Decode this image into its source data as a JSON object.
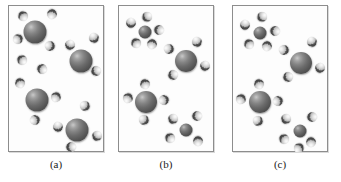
{
  "figure": {
    "type": "molecular-illustration",
    "panel_count": 3,
    "background_color": "#ffffff",
    "panel_border_color": "#8d8d8d",
    "panel_fill_color": "#fdfdfd"
  },
  "legend_colors": {
    "large_sphere": "#6b6b6b",
    "medium_sphere": "#5a5a5a",
    "small_sphere_light_lobe": "#e8e8e8",
    "small_sphere_dark_lobe": "#454545"
  },
  "panels": [
    {
      "label": "(a)",
      "arrangement": "dispersed",
      "large_spheres": 4,
      "small_spheres": 16,
      "particles": [
        {
          "kind": "big",
          "x": 27,
          "y": 27,
          "r": 11.5
        },
        {
          "kind": "big",
          "x": 73,
          "y": 56,
          "r": 11.5
        },
        {
          "kind": "big",
          "x": 29,
          "y": 95,
          "r": 11.5
        },
        {
          "kind": "big",
          "x": 69,
          "y": 125,
          "r": 11.5
        },
        {
          "kind": "small",
          "x": 15,
          "y": 11,
          "r": 5.2
        },
        {
          "kind": "small",
          "x": 44,
          "y": 9,
          "r": 5.2
        },
        {
          "kind": "small",
          "x": 10,
          "y": 34,
          "r": 5.2
        },
        {
          "kind": "small",
          "x": 42,
          "y": 41,
          "r": 5.2
        },
        {
          "kind": "small",
          "x": 86,
          "y": 33,
          "r": 5.2
        },
        {
          "kind": "small",
          "x": 62,
          "y": 40,
          "r": 5.2
        },
        {
          "kind": "small",
          "x": 88,
          "y": 66,
          "r": 5.2
        },
        {
          "kind": "small",
          "x": 34,
          "y": 64,
          "r": 5.2
        },
        {
          "kind": "small",
          "x": 12,
          "y": 78,
          "r": 5.2
        },
        {
          "kind": "small",
          "x": 48,
          "y": 92,
          "r": 5.2
        },
        {
          "kind": "small",
          "x": 27,
          "y": 115,
          "r": 5.2
        },
        {
          "kind": "small",
          "x": 77,
          "y": 101,
          "r": 5.2
        },
        {
          "kind": "small",
          "x": 50,
          "y": 122,
          "r": 5.2
        },
        {
          "kind": "small",
          "x": 89,
          "y": 131,
          "r": 5.2
        },
        {
          "kind": "small",
          "x": 63,
          "y": 142,
          "r": 5.2
        },
        {
          "kind": "small",
          "x": 14,
          "y": 55,
          "r": 5.2
        }
      ]
    },
    {
      "label": "(b)",
      "arrangement": "clustered",
      "large_spheres": 2,
      "medium_spheres": 2,
      "small_spheres": 16,
      "particles": [
        {
          "kind": "mid",
          "x": 27,
          "y": 27,
          "r": 6.5
        },
        {
          "kind": "small",
          "x": 13,
          "y": 18,
          "r": 5.2
        },
        {
          "kind": "small",
          "x": 29,
          "y": 12,
          "r": 5.2
        },
        {
          "kind": "small",
          "x": 41,
          "y": 25,
          "r": 5.2
        },
        {
          "kind": "small",
          "x": 18,
          "y": 38,
          "r": 5.2
        },
        {
          "kind": "small",
          "x": 34,
          "y": 39,
          "r": 5.2
        },
        {
          "kind": "big",
          "x": 68,
          "y": 56,
          "r": 11.0
        },
        {
          "kind": "small",
          "x": 51,
          "y": 44,
          "r": 5.2
        },
        {
          "kind": "small",
          "x": 79,
          "y": 37,
          "r": 5.2
        },
        {
          "kind": "small",
          "x": 87,
          "y": 61,
          "r": 5.2
        },
        {
          "kind": "small",
          "x": 55,
          "y": 70,
          "r": 5.2
        },
        {
          "kind": "big",
          "x": 28,
          "y": 97,
          "r": 11.0
        },
        {
          "kind": "small",
          "x": 27,
          "y": 79,
          "r": 5.2
        },
        {
          "kind": "small",
          "x": 10,
          "y": 93,
          "r": 5.2
        },
        {
          "kind": "small",
          "x": 46,
          "y": 95,
          "r": 5.2
        },
        {
          "kind": "small",
          "x": 26,
          "y": 115,
          "r": 5.2
        },
        {
          "kind": "mid",
          "x": 68,
          "y": 125,
          "r": 6.5
        },
        {
          "kind": "small",
          "x": 55,
          "y": 114,
          "r": 5.2
        },
        {
          "kind": "small",
          "x": 79,
          "y": 111,
          "r": 5.2
        },
        {
          "kind": "small",
          "x": 52,
          "y": 133,
          "r": 5.2
        },
        {
          "kind": "small",
          "x": 80,
          "y": 136,
          "r": 5.2
        }
      ]
    },
    {
      "label": "(c)",
      "arrangement": "clustered",
      "large_spheres": 2,
      "medium_spheres": 2,
      "small_spheres": 17,
      "particles": [
        {
          "kind": "mid",
          "x": 28,
          "y": 28,
          "r": 6.5
        },
        {
          "kind": "small",
          "x": 13,
          "y": 20,
          "r": 5.2
        },
        {
          "kind": "small",
          "x": 30,
          "y": 12,
          "r": 5.2
        },
        {
          "kind": "small",
          "x": 43,
          "y": 26,
          "r": 5.2
        },
        {
          "kind": "small",
          "x": 17,
          "y": 39,
          "r": 5.2
        },
        {
          "kind": "small",
          "x": 35,
          "y": 41,
          "r": 5.2
        },
        {
          "kind": "big",
          "x": 69,
          "y": 58,
          "r": 11.0
        },
        {
          "kind": "small",
          "x": 52,
          "y": 45,
          "r": 5.2
        },
        {
          "kind": "small",
          "x": 80,
          "y": 37,
          "r": 5.2
        },
        {
          "kind": "small",
          "x": 88,
          "y": 63,
          "r": 5.2
        },
        {
          "kind": "small",
          "x": 56,
          "y": 72,
          "r": 5.2
        },
        {
          "kind": "big",
          "x": 28,
          "y": 97,
          "r": 11.0
        },
        {
          "kind": "small",
          "x": 27,
          "y": 79,
          "r": 5.2
        },
        {
          "kind": "small",
          "x": 9,
          "y": 94,
          "r": 5.2
        },
        {
          "kind": "small",
          "x": 46,
          "y": 96,
          "r": 5.2
        },
        {
          "kind": "small",
          "x": 26,
          "y": 116,
          "r": 5.2
        },
        {
          "kind": "mid",
          "x": 68,
          "y": 126,
          "r": 6.5
        },
        {
          "kind": "small",
          "x": 54,
          "y": 114,
          "r": 5.2
        },
        {
          "kind": "small",
          "x": 80,
          "y": 112,
          "r": 5.2
        },
        {
          "kind": "small",
          "x": 52,
          "y": 134,
          "r": 5.2
        },
        {
          "kind": "small",
          "x": 79,
          "y": 137,
          "r": 5.2
        },
        {
          "kind": "small",
          "x": 67,
          "y": 143,
          "r": 5.2
        }
      ]
    }
  ]
}
